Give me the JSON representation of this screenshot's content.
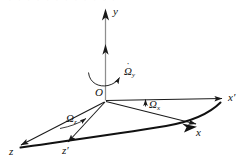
{
  "figure": {
    "title": "",
    "background_color": "#ffffff",
    "line_color": "#1a1a1a",
    "arc_color": "#111111"
  },
  "axes": [
    {
      "id": "y",
      "label": "y",
      "prime": "",
      "position": "top"
    },
    {
      "id": "x-prime",
      "label": "x",
      "prime": "′",
      "position": "right"
    },
    {
      "id": "x",
      "label": "x",
      "prime": "",
      "position": "lower-right"
    },
    {
      "id": "z",
      "label": "z",
      "prime": "",
      "position": "lower-left"
    },
    {
      "id": "z-prime",
      "label": "z",
      "prime": "′",
      "position": "bottom-center"
    }
  ],
  "origin": {
    "label": "O"
  },
  "angular_velocities": [
    {
      "id": "omega-y-dot",
      "symbol": "Ω",
      "subscript": "y",
      "dot": "˙",
      "has_dot": true,
      "note": "rotation about y axis"
    },
    {
      "id": "omega-x",
      "symbol": "Ω",
      "subscript": "x",
      "dot": "",
      "has_dot": false,
      "note": "component along x' axis"
    },
    {
      "id": "omega-z",
      "symbol": "Ω",
      "subscript": "z",
      "dot": "",
      "has_dot": false,
      "note": "component in z plane"
    }
  ],
  "clipped_header": {
    "text": "· · · · · · · · · · · ·"
  }
}
